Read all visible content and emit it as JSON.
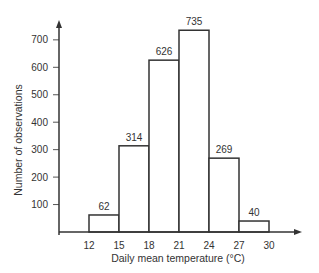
{
  "chart_data": {
    "type": "bar",
    "subtype": "histogram",
    "title": "",
    "xlabel": "Daily mean temperature (°C)",
    "ylabel": "Number of observations",
    "bin_edges": [
      12,
      15,
      18,
      21,
      24,
      27,
      30
    ],
    "categories": [
      "12-15",
      "15-18",
      "18-21",
      "21-24",
      "24-27",
      "27-30"
    ],
    "values": [
      62,
      314,
      626,
      735,
      269,
      40
    ],
    "bar_labels": [
      "62",
      "314",
      "626",
      "735",
      "269",
      "40"
    ],
    "x_ticks": [
      "12",
      "15",
      "18",
      "21",
      "24",
      "27",
      "30"
    ],
    "y_ticks": [
      "100",
      "200",
      "300",
      "400",
      "500",
      "600",
      "700"
    ],
    "ylim": [
      0,
      750
    ],
    "xlim": [
      9,
      32
    ],
    "grid": false,
    "legend": null,
    "colors": {
      "bar_fill": "#ffffff",
      "bar_stroke": "#333333",
      "axis": "#333333"
    }
  }
}
